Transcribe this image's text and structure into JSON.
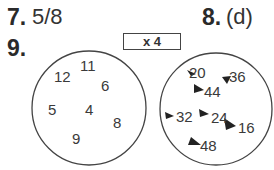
{
  "questions": [
    {
      "number": "7.",
      "answer": "5/8"
    },
    {
      "number": "8.",
      "answer": "(d)"
    },
    {
      "number": "9.",
      "answer": ""
    }
  ],
  "operation_box": {
    "label": "x 4"
  },
  "input_circle": {
    "numbers": [
      "11",
      "12",
      "6",
      "5",
      "4",
      "8",
      "9"
    ]
  },
  "output_circle": {
    "numbers": [
      "20",
      "36",
      "44",
      "32",
      "24",
      "16",
      "48"
    ]
  }
}
